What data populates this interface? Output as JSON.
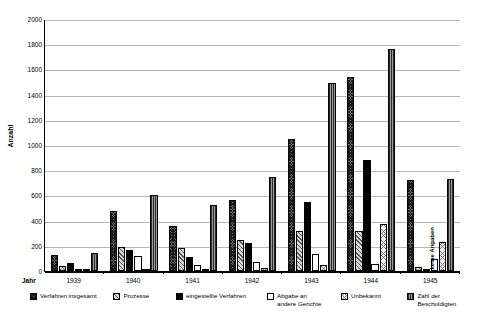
{
  "chart_data": {
    "type": "bar",
    "title": "",
    "xlabel": "Jahr",
    "ylabel": "Anzahl",
    "ylim": [
      0,
      2000
    ],
    "ytick_step": 200,
    "yticks": [
      0,
      200,
      400,
      600,
      800,
      1000,
      1200,
      1400,
      1600,
      1800,
      2000
    ],
    "grid": true,
    "legend_position": "bottom",
    "categories": [
      "1939",
      "1940",
      "1941",
      "1942",
      "1943",
      "1944",
      "1945"
    ],
    "series": [
      {
        "name": "Verfahren insgesamt",
        "key": "vi",
        "values": [
          130,
          480,
          355,
          565,
          1050,
          1540,
          725
        ]
      },
      {
        "name": "Prozesse",
        "key": "pr",
        "values": [
          40,
          190,
          185,
          245,
          320,
          315,
          30
        ]
      },
      {
        "name": "eingestellte Verfahren",
        "key": "ev",
        "values": [
          60,
          165,
          110,
          225,
          545,
          885,
          0
        ]
      },
      {
        "name": "Abgabe an andere Gerichte",
        "key": "ag",
        "values": [
          15,
          120,
          50,
          75,
          135,
          55,
          95
        ]
      },
      {
        "name": "Unbekannt",
        "key": "un",
        "values": [
          2,
          10,
          8,
          20,
          50,
          370,
          230
        ]
      },
      {
        "name": "Zahl der Beschuldigten",
        "key": "zb",
        "values": [
          145,
          605,
          520,
          745,
          1490,
          1760,
          730
        ]
      }
    ],
    "annotations": [
      {
        "text": "keine Angaben",
        "category": "1945",
        "orientation": "vertical"
      }
    ]
  },
  "axis": {
    "jahr_label": "Jahr",
    "y_title": "Anzahl",
    "tick_labels": [
      "2000",
      "1800",
      "1600",
      "1400",
      "1200",
      "1000",
      "800",
      "600",
      "400",
      "200",
      "0"
    ],
    "year_labels": [
      "1939",
      "1940",
      "1941",
      "1942",
      "1943",
      "1944",
      "1945"
    ]
  },
  "legend": {
    "items": [
      {
        "label": "Verfahren insgesamt",
        "swatch": "verfahren-insgesamt-swatch"
      },
      {
        "label": "Prozesse",
        "swatch": "prozesse-swatch"
      },
      {
        "label": "eingestellte Verfahren",
        "swatch": "eingestellte-verfahren-swatch"
      },
      {
        "label": "Abgabe an\nandere Gerichte",
        "swatch": "abgabe-gerichte-swatch"
      },
      {
        "label": "Unbekannt",
        "swatch": "unbekannt-swatch"
      },
      {
        "label": "Zahl der\nBeschuldigten",
        "swatch": "zahl-beschuldigten-swatch"
      }
    ]
  },
  "annotation": {
    "keine_angaben": "keine Angaben"
  }
}
